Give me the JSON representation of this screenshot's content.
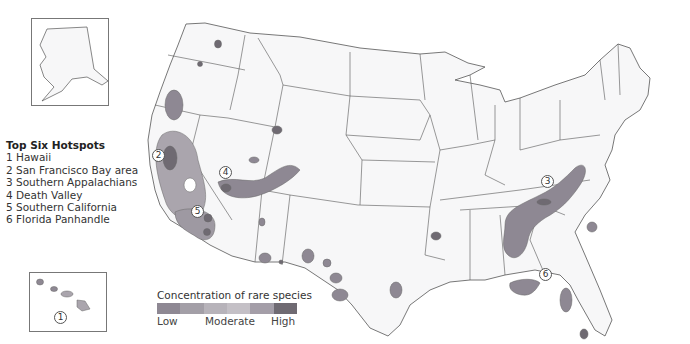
{
  "legend": {
    "title": "Top Six Hotspots",
    "items": [
      {
        "label": "1 Hawaii"
      },
      {
        "label": "2 San Francisco Bay area"
      },
      {
        "label": "3 Southern Appalachians"
      },
      {
        "label": "4 Death Valley"
      },
      {
        "label": "5 Southern California"
      },
      {
        "label": "6 Florida Panhandle"
      }
    ]
  },
  "scale": {
    "title": "Concentration of rare species",
    "low": "Low",
    "moderate": "Moderate",
    "high": "High",
    "colors": [
      "#8e8893",
      "#a39fa7",
      "#b7b3ba",
      "#c4c0c6",
      "#a49ea8",
      "#6f6a72"
    ]
  },
  "markers": [
    {
      "num": "1",
      "name": "Hawaii"
    },
    {
      "num": "2",
      "name": "San Francisco Bay area"
    },
    {
      "num": "3",
      "name": "Southern Appalachians"
    },
    {
      "num": "4",
      "name": "Death Valley"
    },
    {
      "num": "5",
      "name": "Southern California"
    },
    {
      "num": "6",
      "name": "Florida Panhandle"
    }
  ],
  "colors": {
    "land": "#f7f7f8",
    "border": "#555555",
    "hot_low": "#8e8893",
    "hot_mid": "#aaa5ad",
    "hot_high": "#6f6a72"
  }
}
